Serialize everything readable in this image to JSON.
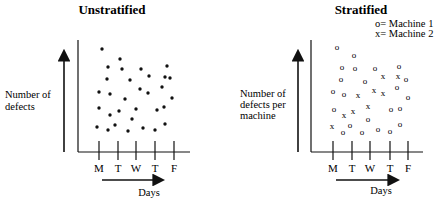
{
  "left_panel": {
    "title": "Unstratified",
    "ylabel_lines": [
      "Number of",
      "defects"
    ],
    "xlabel": "Days",
    "x_ticks": [
      "M",
      "T",
      "W",
      "T",
      "F"
    ]
  },
  "right_panel": {
    "title": "Stratified",
    "ylabel_lines": [
      "Number of",
      "defects per",
      "machine"
    ],
    "xlabel": "Days",
    "x_ticks": [
      "M",
      "T",
      "W",
      "T",
      "F"
    ],
    "legend": [
      "o= Machine 1",
      "x= Machine 2"
    ]
  },
  "chart_data": [
    {
      "type": "scatter",
      "title": "Unstratified",
      "xlabel": "Days",
      "ylabel": "Number of defects",
      "categories": [
        "M",
        "T",
        "W",
        "T",
        "F"
      ],
      "marker": "dot",
      "points_px": [
        [
          102,
          49
        ],
        [
          120,
          59
        ],
        [
          108,
          67
        ],
        [
          122,
          69
        ],
        [
          141,
          69
        ],
        [
          167,
          66
        ],
        [
          107,
          79
        ],
        [
          130,
          80
        ],
        [
          149,
          76
        ],
        [
          165,
          77
        ],
        [
          170,
          78
        ],
        [
          99,
          92
        ],
        [
          110,
          94
        ],
        [
          140,
          89
        ],
        [
          148,
          93
        ],
        [
          162,
          87
        ],
        [
          125,
          99
        ],
        [
          172,
          98
        ],
        [
          99,
          108
        ],
        [
          119,
          111
        ],
        [
          136,
          109
        ],
        [
          157,
          110
        ],
        [
          164,
          107
        ],
        [
          110,
          115
        ],
        [
          132,
          119
        ],
        [
          97,
          127
        ],
        [
          115,
          125
        ],
        [
          108,
          130
        ],
        [
          128,
          131
        ],
        [
          143,
          128
        ],
        [
          155,
          130
        ],
        [
          165,
          124
        ]
      ]
    },
    {
      "type": "scatter",
      "title": "Stratified",
      "xlabel": "Days",
      "ylabel": "Number of defects per machine",
      "categories": [
        "M",
        "T",
        "W",
        "T",
        "F"
      ],
      "series": [
        {
          "name": "Machine 1",
          "marker": "o",
          "points_px": [
            [
              337,
              47
            ],
            [
              354,
              55
            ],
            [
              342,
              67
            ],
            [
              355,
              68
            ],
            [
              375,
              68
            ],
            [
              399,
              66
            ],
            [
              406,
              79
            ],
            [
              341,
              79
            ],
            [
              365,
              81
            ],
            [
              397,
              87
            ],
            [
              333,
              91
            ],
            [
              344,
              94
            ],
            [
              408,
              97
            ],
            [
              334,
              109
            ],
            [
              391,
              109
            ],
            [
              400,
              108
            ],
            [
              368,
              119
            ],
            [
              343,
              132
            ],
            [
              350,
              125
            ],
            [
              362,
              132
            ],
            [
              378,
              129
            ],
            [
              390,
              131
            ],
            [
              400,
              124
            ]
          ]
        },
        {
          "name": "Machine 2",
          "marker": "x",
          "points_px": [
            [
              383,
              76
            ],
            [
              398,
              76
            ],
            [
              374,
              90
            ],
            [
              383,
              93
            ],
            [
              358,
              95
            ],
            [
              368,
              106
            ],
            [
              344,
              115
            ],
            [
              353,
              111
            ],
            [
              332,
              126
            ]
          ]
        }
      ]
    }
  ]
}
